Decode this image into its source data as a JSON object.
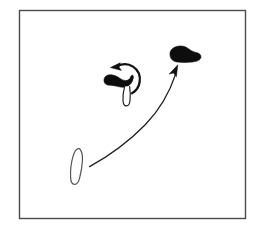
{
  "document": {
    "kind": "hand-drawn-motion-diagram",
    "background_color": "#ffffff",
    "ink_color": "#1a1a1a",
    "canvas": {
      "width": 262,
      "height": 237
    }
  },
  "frame": {
    "label": "drawing-frame",
    "x": 19,
    "y": 10,
    "width": 226,
    "height": 209,
    "stroke_color": "#4a4a4a",
    "stroke_width": 1.4,
    "fill": "none"
  },
  "shapes": [
    {
      "id": "center-blob",
      "label": "solid black boomerang blob with outlined tail",
      "style": "filled",
      "fill_color": "#0d0d0d",
      "stroke_color": "#0d0d0d",
      "center_x": 117,
      "center_y": 83
    },
    {
      "id": "center-tail",
      "label": "outlined tail below center blob",
      "style": "outline",
      "fill_color": "#ffffff",
      "stroke_color": "#1a1a1a",
      "center_x": 128,
      "center_y": 98
    },
    {
      "id": "target-blob",
      "label": "solid black elongated blob upper right",
      "style": "filled",
      "fill_color": "#0d0d0d",
      "stroke_color": "#0d0d0d",
      "center_x": 183,
      "center_y": 55
    },
    {
      "id": "source-outline",
      "label": "outlined teardrop shape lower left",
      "style": "outline",
      "fill_color": "#ffffff",
      "stroke_color": "#555555",
      "center_x": 77,
      "center_y": 167
    }
  ],
  "arrows": [
    {
      "id": "rotation-arrow",
      "label": "curved rotation arrow above center blob",
      "direction": "counter-clockwise",
      "stroke_color": "#111111",
      "stroke_width": 2.2,
      "head_x": 114,
      "head_y": 66
    },
    {
      "id": "trajectory-arrow",
      "label": "long curved trajectory arrow from lower-left shape to upper-right blob",
      "direction": "up-right",
      "stroke_color": "#222222",
      "stroke_width": 1.3,
      "tail_x": 90,
      "tail_y": 166,
      "head_x": 177,
      "head_y": 66
    }
  ]
}
